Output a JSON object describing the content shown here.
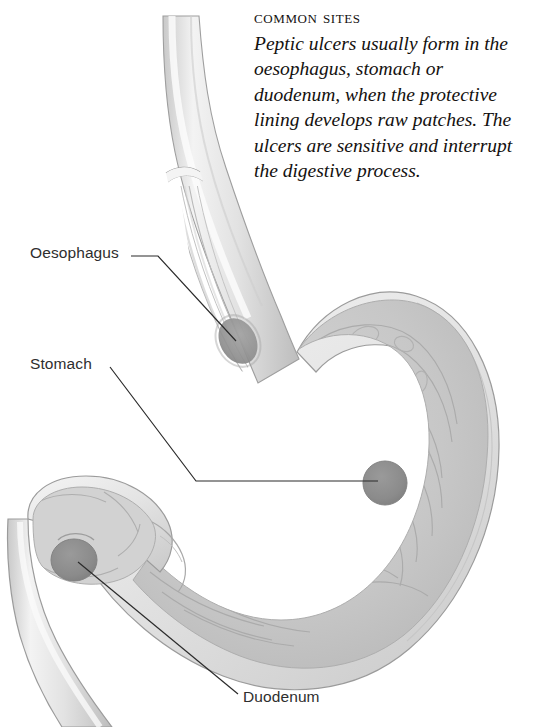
{
  "figure": {
    "caption": {
      "title": "Common sites",
      "body": "Peptic ulcers usually form in the oesophagus, stomach or duodenum, when the protective lining develops raw patches. The ulcers are sensitive and interrupt the digestive process."
    },
    "labels": [
      {
        "id": "oesophagus",
        "text": "Oesophagus"
      },
      {
        "id": "stomach",
        "text": "Stomach"
      },
      {
        "id": "duodenum",
        "text": "Duodenum"
      }
    ],
    "ulcer_sites": [
      {
        "id": "oesophageal-ulcer",
        "organ": "Oesophagus",
        "cx": 238,
        "cy": 341
      },
      {
        "id": "gastric-ulcer",
        "organ": "Stomach",
        "cx": 385,
        "cy": 483
      },
      {
        "id": "duodenal-ulcer",
        "organ": "Duodenum",
        "cx": 74,
        "cy": 560
      }
    ],
    "colors": {
      "background": "#ffffff",
      "text": "#14110f",
      "label_text": "#2e2e2e",
      "leader_line": "#2b2b2b",
      "organ_outline": "#9b9b9b",
      "organ_fill_light": "#efefef",
      "organ_fill_mid": "#d2d2d2",
      "mucosa_fill": "#c8c8c8",
      "fold_line": "#aeaeae",
      "ulcer_fill": "#8d8d8d"
    }
  }
}
